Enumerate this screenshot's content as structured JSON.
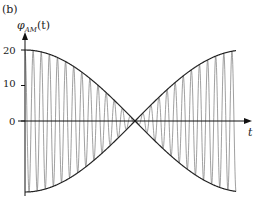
{
  "chart_data": {
    "type": "line",
    "panel_label": "(b)",
    "title": "",
    "ylabel": "φ_AM(t)",
    "ylabel_main": "φ",
    "ylabel_sub": "AM",
    "ylabel_arg": "(t)",
    "xlabel": "t",
    "ylim": [
      -20,
      20
    ],
    "yticks": [
      20,
      10,
      0
    ],
    "ytick_labels": [
      "20",
      "10",
      "0"
    ],
    "xlim": [
      0,
      1
    ],
    "grid": false,
    "legend": "none",
    "series": [
      {
        "name": "upper-envelope",
        "description": "20·|cos(πt)| shape, max 20 at t=0, zero at t≈0.5, max 20 at t≈0.8",
        "points": [
          [
            0,
            20
          ],
          [
            0.25,
            14
          ],
          [
            0.5,
            0
          ],
          [
            0.8,
            20
          ],
          [
            1,
            13
          ]
        ]
      },
      {
        "name": "lower-envelope",
        "description": "mirror of upper envelope",
        "points": [
          [
            0,
            -20
          ],
          [
            0.25,
            -14
          ],
          [
            0.5,
            0
          ],
          [
            0.8,
            -20
          ],
          [
            1,
            -13
          ]
        ]
      },
      {
        "name": "modulated-carrier",
        "description": "high-frequency carrier filling the envelope",
        "carrier_cycles": 26
      }
    ]
  }
}
